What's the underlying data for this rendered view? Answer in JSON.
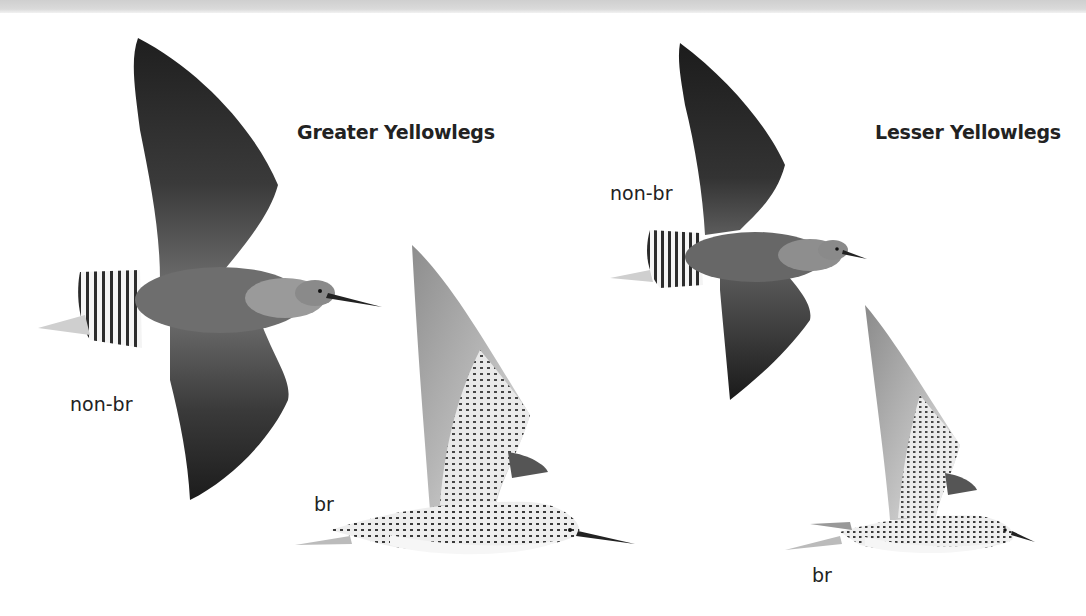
{
  "plate": {
    "species": [
      {
        "name": "Greater Yellowlegs",
        "figures": [
          {
            "label": "non-br",
            "pose": "flight-from-above"
          },
          {
            "label": "br",
            "pose": "flight-side-view"
          }
        ]
      },
      {
        "name": "Lesser Yellowlegs",
        "figures": [
          {
            "label": "non-br",
            "pose": "flight-from-above"
          },
          {
            "label": "br",
            "pose": "flight-side-view"
          }
        ]
      }
    ]
  },
  "colors": {
    "background": "#ffffff",
    "top_band": "#d4d4d4",
    "text": "#222222",
    "wing_dark": "#2a2a2a",
    "body_gray": "#6e6e6e"
  }
}
